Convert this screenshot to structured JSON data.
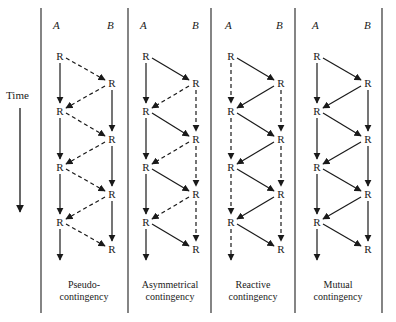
{
  "figure": {
    "time_label": "Time",
    "node_label": "R",
    "colors": {
      "ink": "#1a1a1a",
      "background": "#ffffff"
    },
    "panels": [
      {
        "id": "pseudo",
        "actor_a": "A",
        "actor_b": "B",
        "caption_line1": "Pseudo-",
        "caption_line2": "contingency",
        "a_vertical": "solid",
        "b_vertical": "solid",
        "a_to_b": "dashed",
        "b_to_a": "dashed"
      },
      {
        "id": "asymmetrical",
        "actor_a": "A",
        "actor_b": "B",
        "caption_line1": "Asymmetrical",
        "caption_line2": "contingency",
        "a_vertical": "solid",
        "b_vertical": "dashed",
        "a_to_b": "solid",
        "b_to_a": "dashed"
      },
      {
        "id": "reactive",
        "actor_a": "A",
        "actor_b": "B",
        "caption_line1": "Reactive",
        "caption_line2": "contingency",
        "a_vertical": "dashed",
        "b_vertical": "dashed",
        "a_to_b": "solid",
        "b_to_a": "solid"
      },
      {
        "id": "mutual",
        "actor_a": "A",
        "actor_b": "B",
        "caption_line1": "Mutual",
        "caption_line2": "contingency",
        "a_vertical": "solid",
        "b_vertical": "solid",
        "a_to_b": "solid",
        "b_to_a": "solid"
      }
    ]
  }
}
